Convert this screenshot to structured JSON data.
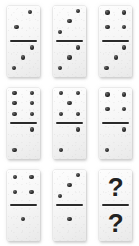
{
  "puzzle": {
    "title": "Domino sequence puzzle",
    "background_color": "#ffffff",
    "tile_color": "#f4f4f4",
    "pip_color": "#222222",
    "divider_color": "#2a2a2a",
    "rows": 3,
    "columns": 3,
    "unknown_glyph": "?",
    "tiles": [
      {
        "index": 1,
        "position": "row1-col1",
        "top": {
          "value": 2,
          "layout": "diagonal",
          "pips": [
            [
              70,
              18
            ],
            [
              30,
              62
            ]
          ]
        },
        "bottom": {
          "value": 3,
          "layout": "diagonal",
          "pips": [
            [
              76,
              16
            ],
            [
              50,
              45
            ],
            [
              22,
              76
            ]
          ]
        },
        "label": "2 over 3"
      },
      {
        "index": 2,
        "position": "row1-col2",
        "top": {
          "value": 3,
          "layout": "diagonal",
          "pips": [
            [
              76,
              16
            ],
            [
              50,
              45
            ],
            [
              22,
              76
            ]
          ]
        },
        "bottom": {
          "value": 3,
          "layout": "diagonal",
          "pips": [
            [
              76,
              16
            ],
            [
              50,
              45
            ],
            [
              22,
              76
            ]
          ]
        },
        "label": "3 over 3"
      },
      {
        "index": 3,
        "position": "row1-col3",
        "top": {
          "value": 4,
          "layout": "square",
          "pips": [
            [
              25,
              20
            ],
            [
              75,
              20
            ],
            [
              25,
              62
            ],
            [
              75,
              62
            ]
          ]
        },
        "bottom": {
          "value": 3,
          "layout": "diagonal",
          "pips": [
            [
              76,
              16
            ],
            [
              50,
              45
            ],
            [
              22,
              76
            ]
          ]
        },
        "label": "4 over 3"
      },
      {
        "index": 4,
        "position": "row2-col1",
        "top": {
          "value": 6,
          "layout": "two-columns-of-three",
          "pips": [
            [
              24,
              15
            ],
            [
              24,
              45
            ],
            [
              24,
              76
            ],
            [
              76,
              15
            ],
            [
              76,
              45
            ],
            [
              76,
              76
            ]
          ]
        },
        "bottom": {
          "value": 2,
          "layout": "diagonal",
          "pips": [
            [
              76,
              16
            ],
            [
              24,
              76
            ]
          ]
        },
        "label": "6 over 2"
      },
      {
        "index": 5,
        "position": "row2-col2",
        "top": {
          "value": 5,
          "layout": "quincunx",
          "pips": [
            [
              24,
              16
            ],
            [
              76,
              16
            ],
            [
              50,
              45
            ],
            [
              24,
              76
            ],
            [
              76,
              76
            ]
          ]
        },
        "bottom": {
          "value": 2,
          "layout": "diagonal",
          "pips": [
            [
              76,
              16
            ],
            [
              24,
              76
            ]
          ]
        },
        "label": "5 over 2"
      },
      {
        "index": 6,
        "position": "row2-col3",
        "top": {
          "value": 4,
          "layout": "square",
          "pips": [
            [
              25,
              20
            ],
            [
              75,
              20
            ],
            [
              25,
              62
            ],
            [
              75,
              62
            ]
          ]
        },
        "bottom": {
          "value": 2,
          "layout": "diagonal",
          "pips": [
            [
              76,
              16
            ],
            [
              24,
              76
            ]
          ]
        },
        "label": "4 over 2"
      },
      {
        "index": 7,
        "position": "row3-col1",
        "top": {
          "value": 4,
          "layout": "square",
          "pips": [
            [
              25,
              22
            ],
            [
              75,
              22
            ],
            [
              25,
              66
            ],
            [
              75,
              66
            ]
          ]
        },
        "bottom": {
          "value": 1,
          "layout": "center",
          "pips": [
            [
              50,
              38
            ]
          ]
        },
        "label": "4 over 1"
      },
      {
        "index": 8,
        "position": "row3-col2",
        "top": {
          "value": 3,
          "layout": "diagonal",
          "pips": [
            [
              76,
              16
            ],
            [
              50,
              45
            ],
            [
              22,
              76
            ]
          ]
        },
        "bottom": {
          "value": 1,
          "layout": "center",
          "pips": [
            [
              50,
              38
            ]
          ]
        },
        "label": "3 over 1"
      },
      {
        "index": 9,
        "position": "row3-col3",
        "top": {
          "value": "?",
          "layout": "unknown",
          "pips": []
        },
        "bottom": {
          "value": "?",
          "layout": "unknown",
          "pips": []
        },
        "label": "unknown over unknown"
      }
    ]
  }
}
